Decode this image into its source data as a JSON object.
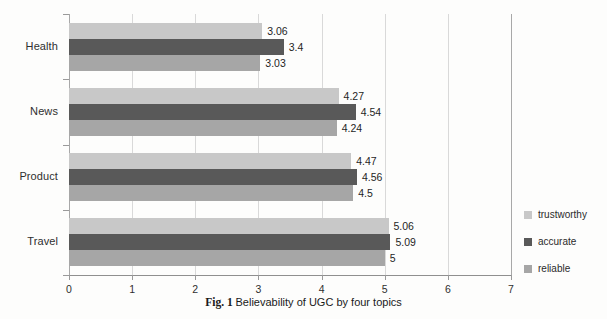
{
  "chart_data": {
    "type": "bar",
    "orientation": "horizontal",
    "title": "",
    "caption_prefix": "Fig. 1",
    "caption_text": "Believability of UGC by four topics",
    "xlabel": "",
    "ylabel": "",
    "xlim": [
      0,
      7
    ],
    "xticks": [
      0,
      1,
      2,
      3,
      4,
      5,
      6,
      7
    ],
    "xtick_labels": [
      "0",
      "1",
      "2",
      "3",
      "4",
      "5",
      "6",
      "7"
    ],
    "grid": "vertical",
    "legend_position": "right",
    "categories": [
      "Health",
      "News",
      "Product",
      "Travel"
    ],
    "series": [
      {
        "name": "trustworthy",
        "color": "#c8c8c8",
        "values": [
          3.06,
          4.27,
          4.47,
          5.06
        ],
        "labels": [
          "3.06",
          "4.27",
          "4.47",
          "5.06"
        ]
      },
      {
        "name": "accurate",
        "color": "#595959",
        "values": [
          3.4,
          4.54,
          4.56,
          5.09
        ],
        "labels": [
          "3.4",
          "4.54",
          "4.56",
          "5.09"
        ]
      },
      {
        "name": "reliable",
        "color": "#a6a6a6",
        "values": [
          3.03,
          4.24,
          4.5,
          5.0
        ],
        "labels": [
          "3.03",
          "4.24",
          "4.5",
          "5"
        ]
      }
    ]
  },
  "legend": {
    "items": [
      {
        "label": "trustworthy",
        "key": "trustworthy"
      },
      {
        "label": "accurate",
        "key": "accurate"
      },
      {
        "label": "reliable",
        "key": "reliable"
      }
    ]
  },
  "axis": {
    "y_categories": [
      "Health",
      "News",
      "Product",
      "Travel"
    ],
    "x_tick_labels": [
      "0",
      "1",
      "2",
      "3",
      "4",
      "5",
      "6",
      "7"
    ]
  },
  "caption": {
    "prefix": "Fig. 1",
    "text": "Believability of UGC by four topics"
  },
  "colors": {
    "trustworthy": "#c8c8c8",
    "accurate": "#595959",
    "reliable": "#a6a6a6",
    "grid": "#d9d9d9",
    "axis": "#8f8f8f",
    "background": "#fdfdfc"
  }
}
